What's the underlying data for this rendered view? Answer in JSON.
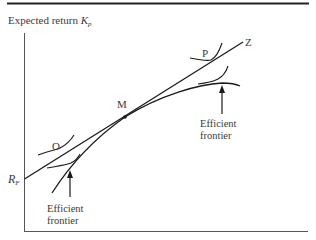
{
  "figure": {
    "y_axis_label": "Expected return",
    "y_axis_symbol": "K",
    "y_axis_subscript": "p",
    "intercept_label": "R",
    "intercept_subscript": "F",
    "points": {
      "O": "O",
      "M": "M",
      "P": "P",
      "Z": "Z"
    },
    "frontier_labels": [
      {
        "line1": "Efficient",
        "line2": "frontier",
        "position": "upper-right"
      },
      {
        "line1": "Efficient",
        "line2": "frontier",
        "position": "lower-left"
      }
    ],
    "colors": {
      "line": "#1a1a1a",
      "text": "#3a3a3a",
      "rule": "#222222"
    }
  }
}
